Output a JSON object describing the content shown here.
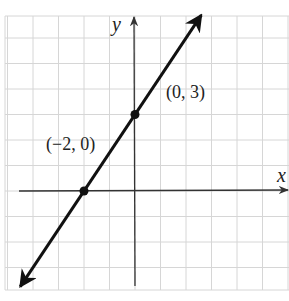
{
  "chart_data": {
    "type": "line",
    "title": "",
    "xlabel": "x",
    "ylabel": "y",
    "xlim": [
      -5,
      6
    ],
    "ylim": [
      -4,
      7
    ],
    "grid": true,
    "grid_step": 1,
    "series": [
      {
        "name": "line",
        "equation": "y = (3/2)x + 3",
        "slope": 1.5,
        "y_intercept": 3,
        "x_intercept": -2,
        "x": [
          -4.5,
          2.6
        ],
        "y": [
          -3.75,
          6.9
        ],
        "arrows": "both"
      }
    ],
    "points": [
      {
        "x": -2,
        "y": 0,
        "label": "(−2, 0)"
      },
      {
        "x": 0,
        "y": 3,
        "label": "(0, 3)"
      }
    ],
    "colors": {
      "line": "#111111",
      "axis": "#333333",
      "grid": "#d6d6d6"
    }
  },
  "labels": {
    "x_axis": "x",
    "y_axis": "y",
    "point_a": "(−2, 0)",
    "point_b": "(0, 3)"
  }
}
